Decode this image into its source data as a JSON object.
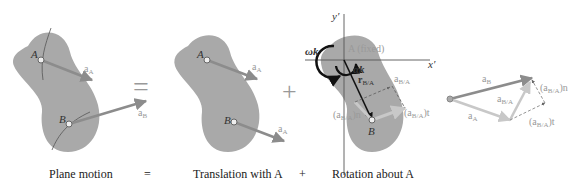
{
  "captions": {
    "plane_motion": "Plane motion",
    "equals": "=",
    "translation": "Translation with A",
    "plus": "+",
    "rotation": "Rotation about A"
  },
  "panel1": {
    "point_a": "A",
    "point_b": "B",
    "vec_a": "a",
    "vec_a_sub": "A",
    "vec_b": "a",
    "vec_b_sub": "B"
  },
  "operator_equals": "=",
  "panel2": {
    "point_a": "A",
    "point_b": "B",
    "vec_a": "a",
    "vec_a_sub": "A",
    "vec_b": "a",
    "vec_b_sub": "A"
  },
  "operator_plus": "+",
  "panel3": {
    "y_axis": "y′",
    "x_axis": "x′",
    "omega_k": "ωk",
    "alpha_k": "αk",
    "fixed_label": "A (fixed)",
    "r_ba": "r",
    "r_ba_sub": "B/A",
    "a_ba": "a",
    "a_ba_sub": "B/A",
    "a_ba_n": "(a",
    "a_ba_n_sub": "B/A",
    "a_ba_n_end": ")n",
    "a_ba_t": "(a",
    "a_ba_t_sub": "B/A",
    "a_ba_t_end": ")t",
    "point_b": "B"
  },
  "panel4": {
    "a_b": "a",
    "a_b_sub": "B",
    "a_ba": "a",
    "a_ba_sub": "B/A",
    "a_a": "a",
    "a_a_sub": "A",
    "a_ba_n": "(a",
    "a_ba_n_sub": "B/A",
    "a_ba_n_end": ")n",
    "a_ba_t": "(a",
    "a_ba_t_sub": "B/A",
    "a_ba_t_end": ")t"
  },
  "colors": {
    "body_fill": "#a9a9a9",
    "vector": "#8c8c8c",
    "light_vector": "#c8c8c8",
    "axis": "#555555"
  }
}
